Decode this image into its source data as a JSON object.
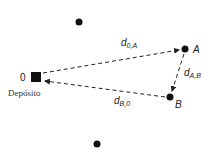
{
  "diagram": {
    "title": "",
    "depot": {
      "id": "0",
      "label": "Depósito"
    },
    "nodes": [
      {
        "id": "A",
        "label": "A"
      },
      {
        "id": "B",
        "label": "B"
      }
    ],
    "other_nodes": 2,
    "edges": [
      {
        "from": "0",
        "to": "A",
        "label_main": "d",
        "label_sub": "0,A"
      },
      {
        "from": "A",
        "to": "B",
        "label_main": "d",
        "label_sub": "A,B"
      },
      {
        "from": "B",
        "to": "0",
        "label_main": "d",
        "label_sub": "B,0"
      }
    ],
    "colors": {
      "node": "#111111",
      "line": "#222222",
      "text": "#222222"
    }
  }
}
